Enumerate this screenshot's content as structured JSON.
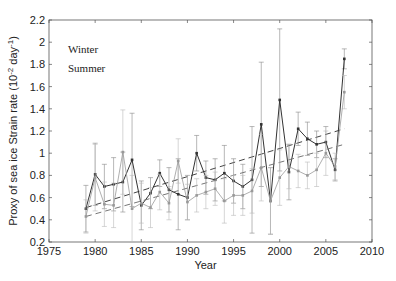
{
  "chart_data": {
    "type": "line",
    "title": "",
    "xlabel": "Year",
    "ylabel": "Proxy of sea ice Strain rate (10^-2 day^-1)",
    "xlim": [
      1975,
      2010
    ],
    "ylim": [
      0.2,
      2.2
    ],
    "xticks": [
      1975,
      1980,
      1985,
      1990,
      1995,
      2000,
      2005,
      2010
    ],
    "yticks": [
      0.2,
      0.4,
      0.6,
      0.8,
      1,
      1.2,
      1.4,
      1.6,
      1.8,
      2,
      2.2
    ],
    "grid": false,
    "legend": [
      "Winter",
      "Summer"
    ],
    "legend_position": "upper left",
    "x": [
      1979,
      1980,
      1981,
      1982,
      1983,
      1984,
      1985,
      1986,
      1987,
      1988,
      1989,
      1990,
      1991,
      1992,
      1993,
      1994,
      1995,
      1996,
      1997,
      1998,
      1999,
      2000,
      2001,
      2002,
      2003,
      2004,
      2005,
      2006,
      2007
    ],
    "series": [
      {
        "name": "Winter",
        "color": "#333333",
        "values": [
          0.5,
          0.81,
          0.7,
          0.72,
          0.74,
          0.94,
          0.53,
          0.64,
          0.82,
          0.67,
          0.63,
          0.6,
          1.0,
          0.78,
          0.76,
          0.82,
          0.75,
          0.7,
          0.76,
          1.26,
          0.57,
          1.48,
          0.83,
          1.22,
          1.13,
          1.08,
          1.1,
          0.85,
          1.85
        ],
        "error": [
          0.21,
          0.28,
          0.2,
          0.24,
          0.27,
          0.42,
          0.22,
          0.14,
          0.12,
          0.2,
          0.32,
          0.2,
          0.16,
          0.15,
          0.19,
          0.25,
          0.2,
          0.2,
          0.48,
          0.56,
          0.3,
          0.64,
          0.25,
          0.15,
          0.15,
          0.12,
          0.14,
          0.1,
          0.09
        ],
        "trend": [
          0.51,
          1.22
        ]
      },
      {
        "name": "Summer",
        "color": "#999999",
        "values": [
          0.43,
          0.78,
          0.54,
          0.53,
          1.01,
          0.5,
          0.55,
          0.51,
          0.65,
          0.55,
          0.93,
          0.56,
          0.62,
          0.65,
          0.68,
          0.57,
          0.62,
          0.62,
          0.66,
          0.87,
          0.57,
          0.78,
          0.88,
          0.84,
          0.8,
          0.85,
          1.0,
          0.88,
          1.55
        ],
        "error": [
          0.15,
          0.3,
          0.2,
          0.2,
          0.38,
          0.3,
          0.18,
          0.18,
          0.16,
          0.15,
          0.2,
          0.16,
          0.15,
          0.15,
          0.15,
          0.2,
          0.18,
          0.18,
          0.2,
          0.3,
          0.3,
          0.25,
          0.2,
          0.15,
          0.12,
          0.15,
          0.2,
          0.12,
          0.15
        ],
        "trend": [
          0.43,
          1.08
        ]
      }
    ]
  }
}
